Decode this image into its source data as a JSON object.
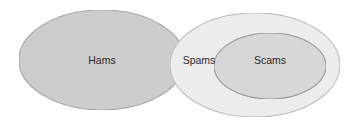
{
  "diagram": {
    "type": "euler",
    "sets": [
      {
        "id": "hams",
        "label": "Hams",
        "fill": "#cfcfcf",
        "stroke": "#a8a8a8",
        "center": [
          102,
          60
        ],
        "rx": 83,
        "ry": 50,
        "label_pos": [
          102,
          61
        ]
      },
      {
        "id": "spams",
        "label": "Spams",
        "fill": "#f1f1f1",
        "stroke": "#bdbdbd",
        "center": [
          255,
          65
        ],
        "rx": 85,
        "ry": 52,
        "label_pos": [
          199,
          61
        ]
      },
      {
        "id": "scams",
        "label": "Scams",
        "fill": "#dadada",
        "stroke": "#9a9a9a",
        "center": [
          270,
          66
        ],
        "rx": 56,
        "ry": 33,
        "label_pos": [
          270,
          61
        ]
      }
    ],
    "relations": [
      "Scams is a subset of Spams",
      "Hams and Spams are disjoint regions drawn adjacent/overlapping visually"
    ]
  }
}
